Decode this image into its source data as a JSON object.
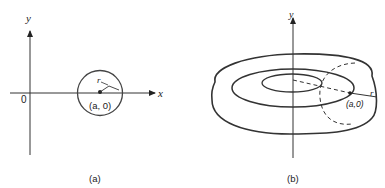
{
  "figure_a": {
    "caption": "(a)",
    "y_axis_label": "y",
    "x_axis_label": "x",
    "origin_label": "0",
    "radius_label": "r",
    "center_label": "(a, 0)"
  },
  "figure_b": {
    "caption": "(b)",
    "y_axis_label": "y",
    "radius_label": "r",
    "center_label": "(a,0)"
  },
  "colors": {
    "stroke": "#3a3a3a",
    "background": "#ffffff"
  }
}
